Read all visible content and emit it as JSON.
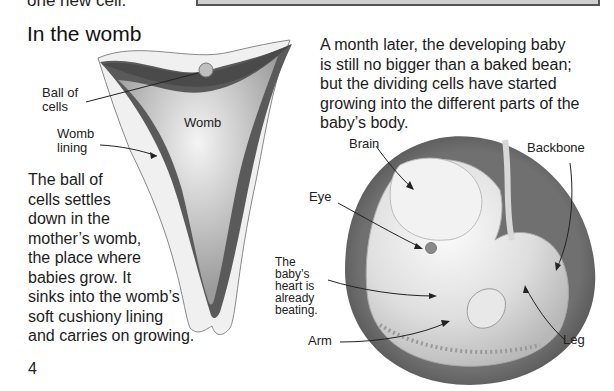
{
  "page": {
    "partial_top_text": "one new cell.",
    "heading": "In the womb",
    "page_number": "4"
  },
  "womb_diagram": {
    "labels": {
      "ball_of_cells": [
        "Ball of",
        "cells"
      ],
      "womb_lining": [
        "Womb",
        "lining"
      ],
      "womb": "Womb"
    },
    "caption_lines": [
      "The ball of",
      "cells settles",
      "down in the",
      "mother’s womb,",
      "the place where",
      "babies grow. It",
      "sinks into the womb’s",
      "soft cushiony lining",
      "and carries on growing."
    ]
  },
  "embryo_diagram": {
    "intro_lines": [
      "A month later, the developing baby",
      "is still no bigger than a baked bean;",
      "but the dividing cells have started",
      "growing into the different parts of the",
      "baby’s body."
    ],
    "labels": {
      "brain": "Brain",
      "eye": "Eye",
      "heart": [
        "The",
        "baby’s",
        "heart is",
        "already",
        "beating."
      ],
      "arm": "Arm",
      "backbone": "Backbone",
      "leg": "Leg"
    }
  },
  "colors": {
    "womb_outer": "#efefef",
    "womb_lining": "#5e5e5e",
    "womb_cavity": "#bdbdbd",
    "embryo_sac": "#6a6a6a",
    "embryo_body": "#e4e4e4",
    "top_box_fill": "#cfcfcf",
    "top_box_border": "#555555"
  }
}
